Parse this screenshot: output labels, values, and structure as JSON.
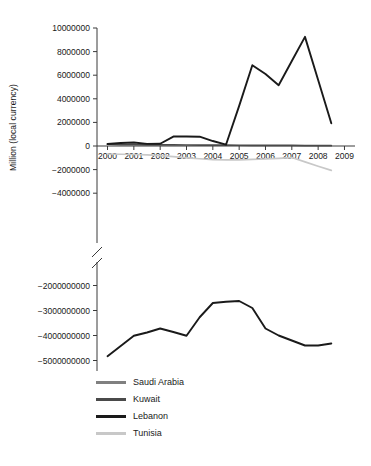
{
  "chart_data": {
    "type": "line",
    "title": "",
    "xlabel": "",
    "ylabel": "Million (local currency)",
    "grid": false,
    "legend_position": "bottom-left",
    "broken_axis": true,
    "axis_note": "Y-axis is broken between -4000000 (upper panel) and -2000000000 (lower panel)",
    "x": [
      2000,
      2000.5,
      2001,
      2001.5,
      2002,
      2002.5,
      2003,
      2003.5,
      2004,
      2004.5,
      2005,
      2005.5,
      2006,
      2006.5,
      2007,
      2007.5,
      2008,
      2008.5
    ],
    "xtick_labels": [
      "2000",
      "2001",
      "2002",
      "2003",
      "2004",
      "2005",
      "2006",
      "2007",
      "2008",
      "2009"
    ],
    "xticks": [
      2000,
      2001,
      2002,
      2003,
      2004,
      2005,
      2006,
      2007,
      2008,
      2009
    ],
    "xlim": [
      1999.6,
      2009.4
    ],
    "upper_panel": {
      "ylim": [
        -5000000,
        10000000
      ],
      "yticks": [
        -4000000,
        -2000000,
        0,
        2000000,
        4000000,
        6000000,
        8000000,
        10000000
      ],
      "ytick_labels": [
        "-4000000",
        "-2000000",
        "0",
        "2000000",
        "4000000",
        "6000000",
        "8000000",
        "10000000"
      ]
    },
    "lower_panel": {
      "ylim": [
        -5300000000,
        -1700000000
      ],
      "yticks": [
        -5000000000,
        -4000000000,
        -3000000000,
        -2000000000
      ],
      "ytick_labels": [
        "-5000000000",
        "-4000000000",
        "-3000000000",
        "-2000000000"
      ]
    },
    "series": [
      {
        "name": "Saudi Arabia",
        "color": "#808080",
        "panel": "lower",
        "values": [
          -4830000000,
          -4420000000,
          -4010000000,
          -3880000000,
          -3720000000,
          -3860000000,
          -4010000000,
          -3270000000,
          -2700000000,
          -2650000000,
          -2620000000,
          -2900000000,
          -3720000000,
          -4000000000,
          -4200000000,
          -4400000000,
          -4400000000,
          -4320000000
        ]
      },
      {
        "name": "Kuwait",
        "color": "#4a4a4a",
        "panel": "upper",
        "values": [
          150000,
          120000,
          110000,
          100000,
          95000,
          90000,
          85000,
          80000,
          75000,
          70000,
          65000,
          60000,
          55000,
          50000,
          45000,
          40000,
          35000,
          30000
        ]
      },
      {
        "name": "Lebanon",
        "color": "#1a1a1a",
        "panel": "upper",
        "values": [
          170000,
          250000,
          300000,
          180000,
          190000,
          800000,
          800000,
          790000,
          420000,
          110000,
          3400000,
          6850000,
          6100000,
          5150000,
          7200000,
          9250000,
          5600000,
          1920000
        ]
      },
      {
        "name": "Tunisia",
        "color": "#c8c8c8",
        "panel": "upper",
        "values": [
          -680000,
          -700000,
          -720000,
          -760000,
          -820000,
          -900000,
          -1000000,
          -1080000,
          -1150000,
          -1180000,
          -1170000,
          -1140000,
          -1100000,
          -1050000,
          -980000,
          -1350000,
          -1720000,
          -2070000
        ]
      }
    ]
  },
  "axis": {
    "ylabel": "Million (local currency)"
  },
  "legend": {
    "items": [
      {
        "label": "Saudi Arabia",
        "color": "#808080"
      },
      {
        "label": "Kuwait",
        "color": "#4a4a4a"
      },
      {
        "label": "Lebanon",
        "color": "#1a1a1a"
      },
      {
        "label": "Tunisia",
        "color": "#c8c8c8"
      }
    ]
  }
}
